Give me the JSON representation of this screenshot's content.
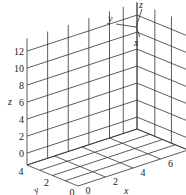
{
  "chart_data": {
    "type": "3d-axes",
    "title": "",
    "xlabel": "x",
    "ylabel": "y",
    "zlabel": "z",
    "xlim": [
      0,
      8
    ],
    "ylim": [
      0,
      4
    ],
    "zlim": [
      0,
      13.5
    ],
    "x_ticks": [
      "0",
      "2",
      "4",
      "6",
      "8"
    ],
    "y_ticks": [
      "0",
      "2",
      "4"
    ],
    "z_ticks": [
      "0",
      "2",
      "4",
      "6",
      "8",
      "10",
      "12"
    ],
    "grid": true,
    "box_planes": [
      "back x-z wall",
      "right y-z wall",
      "floor x-y"
    ],
    "orientation_triad": {
      "labels": [
        "x",
        "y",
        "z"
      ]
    },
    "series": []
  },
  "triad": {
    "x": "x",
    "y": "y",
    "z": "z"
  },
  "colors": {
    "line": "#333333",
    "background": "#ffffff"
  }
}
